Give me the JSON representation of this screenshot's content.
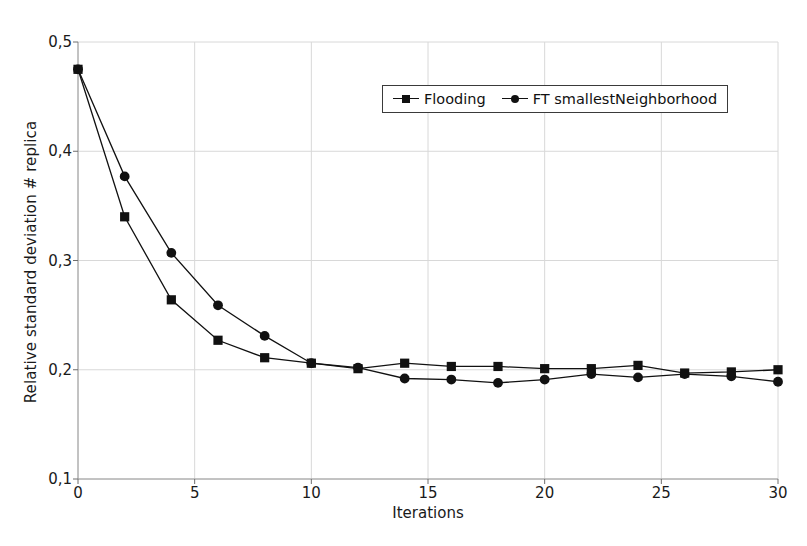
{
  "chart_data": {
    "type": "line",
    "title": "",
    "subtitle": "",
    "xlabel": "Iterations",
    "ylabel": "Relative standard deviation # replica",
    "xlim": [
      0,
      30
    ],
    "ylim": [
      0.1,
      0.5
    ],
    "xticks": [
      0,
      5,
      10,
      15,
      20,
      25,
      30
    ],
    "xtick_labels": [
      "0",
      "5",
      "10",
      "15",
      "20",
      "25",
      "30"
    ],
    "yticks": [
      0.1,
      0.2,
      0.3,
      0.4,
      0.5
    ],
    "ytick_labels": [
      "0,1",
      "0,2",
      "0,3",
      "0,4",
      "0,5"
    ],
    "grid": true,
    "grid_color": "#d8d8d8",
    "legend_position": "top-center",
    "x": [
      0,
      2,
      4,
      6,
      8,
      10,
      12,
      14,
      16,
      18,
      20,
      22,
      24,
      26,
      28,
      30
    ],
    "series": [
      {
        "name": "Flooding",
        "marker": "square",
        "color": "#111111",
        "values": [
          0.475,
          0.34,
          0.264,
          0.227,
          0.211,
          0.206,
          0.201,
          0.206,
          0.203,
          0.203,
          0.201,
          0.201,
          0.204,
          0.197,
          0.198,
          0.2
        ]
      },
      {
        "name": "FT smallestNeighborhood",
        "marker": "circle",
        "color": "#111111",
        "values": [
          0.475,
          0.377,
          0.307,
          0.259,
          0.231,
          0.206,
          0.202,
          0.192,
          0.191,
          0.188,
          0.191,
          0.196,
          0.193,
          0.196,
          0.194,
          0.189
        ]
      }
    ]
  },
  "legend": {
    "entries": [
      {
        "label": "Flooding",
        "marker": "square-marker"
      },
      {
        "label": "FT smallestNeighborhood",
        "marker": "circle-marker"
      }
    ]
  }
}
